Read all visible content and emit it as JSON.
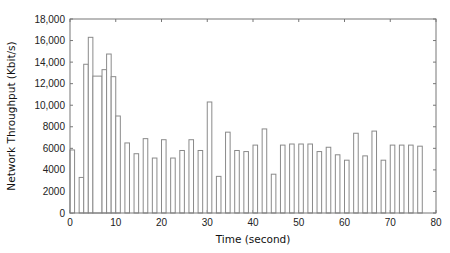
{
  "chart_data": {
    "type": "bar",
    "title": "",
    "xlabel": "Time (second)",
    "ylabel": "Network Throughput (Kbit/s)",
    "xlim": [
      0,
      80
    ],
    "ylim": [
      0,
      18000
    ],
    "grid": false,
    "legend": null,
    "x_ticks": [
      0,
      10,
      20,
      30,
      40,
      50,
      60,
      70,
      80
    ],
    "x_tick_labels": [
      "0",
      "10",
      "20",
      "30",
      "40",
      "50",
      "60",
      "70",
      "80"
    ],
    "y_ticks": [
      0,
      2000,
      4000,
      6000,
      8000,
      10000,
      12000,
      14000,
      16000,
      18000
    ],
    "y_tick_labels": [
      "0",
      "2000",
      "4000",
      "6000",
      "8000",
      "10,000",
      "12,000",
      "14,000",
      "16,000",
      "18,000"
    ],
    "bars": [
      {
        "x0": 0,
        "x1": 1,
        "value": 5850
      },
      {
        "x0": 2,
        "x1": 3,
        "value": 3300
      },
      {
        "x0": 3,
        "x1": 4,
        "value": 13800
      },
      {
        "x0": 4,
        "x1": 5,
        "value": 16300
      },
      {
        "x0": 5,
        "x1": 7,
        "value": 12700
      },
      {
        "x0": 7,
        "x1": 8,
        "value": 13300
      },
      {
        "x0": 8,
        "x1": 9,
        "value": 14750
      },
      {
        "x0": 9,
        "x1": 10,
        "value": 12650
      },
      {
        "x0": 10,
        "x1": 11,
        "value": 9000
      },
      {
        "x0": 12,
        "x1": 13,
        "value": 6500
      },
      {
        "x0": 14,
        "x1": 15,
        "value": 5500
      },
      {
        "x0": 16,
        "x1": 17,
        "value": 6900
      },
      {
        "x0": 18,
        "x1": 19,
        "value": 5100
      },
      {
        "x0": 20,
        "x1": 21,
        "value": 6800
      },
      {
        "x0": 22,
        "x1": 23,
        "value": 5100
      },
      {
        "x0": 24,
        "x1": 25,
        "value": 5800
      },
      {
        "x0": 26,
        "x1": 27,
        "value": 6800
      },
      {
        "x0": 28,
        "x1": 29,
        "value": 5800
      },
      {
        "x0": 30,
        "x1": 31,
        "value": 10300
      },
      {
        "x0": 32,
        "x1": 33,
        "value": 3400
      },
      {
        "x0": 34,
        "x1": 35,
        "value": 7500
      },
      {
        "x0": 36,
        "x1": 37,
        "value": 5800
      },
      {
        "x0": 38,
        "x1": 39,
        "value": 5700
      },
      {
        "x0": 40,
        "x1": 41,
        "value": 6300
      },
      {
        "x0": 42,
        "x1": 43,
        "value": 7800
      },
      {
        "x0": 44,
        "x1": 45,
        "value": 3600
      },
      {
        "x0": 46,
        "x1": 47,
        "value": 6300
      },
      {
        "x0": 48,
        "x1": 49,
        "value": 6400
      },
      {
        "x0": 50,
        "x1": 51,
        "value": 6400
      },
      {
        "x0": 52,
        "x1": 53,
        "value": 6400
      },
      {
        "x0": 54,
        "x1": 55,
        "value": 5700
      },
      {
        "x0": 56,
        "x1": 57,
        "value": 6100
      },
      {
        "x0": 58,
        "x1": 59,
        "value": 5400
      },
      {
        "x0": 60,
        "x1": 61,
        "value": 4900
      },
      {
        "x0": 62,
        "x1": 63,
        "value": 7400
      },
      {
        "x0": 64,
        "x1": 65,
        "value": 5300
      },
      {
        "x0": 66,
        "x1": 67,
        "value": 7600
      },
      {
        "x0": 68,
        "x1": 69,
        "value": 4900
      },
      {
        "x0": 70,
        "x1": 71,
        "value": 6300
      },
      {
        "x0": 72,
        "x1": 73,
        "value": 6300
      },
      {
        "x0": 74,
        "x1": 75,
        "value": 6300
      },
      {
        "x0": 76,
        "x1": 77,
        "value": 6200
      }
    ],
    "style": {
      "bar_stroke": "#8a8a8a",
      "bar_fill": "#ffffff",
      "frame_color": "#777777"
    }
  }
}
